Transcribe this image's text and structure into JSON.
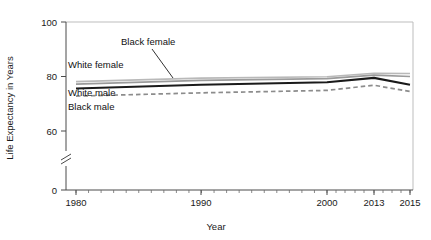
{
  "chart_data": {
    "type": "line",
    "title": "",
    "xlabel": "Year",
    "ylabel": "Life Expectancy in Years",
    "x": [
      1980,
      1990,
      2000,
      2013,
      2015
    ],
    "xtick_labels": [
      "1980",
      "1990",
      "2000",
      "2013",
      "2015"
    ],
    "ytick_labels": [
      "0",
      "60",
      "80",
      "100"
    ],
    "ytick_values": [
      0,
      60,
      80,
      100
    ],
    "ylim": [
      0,
      100
    ],
    "y_axis_break": true,
    "y_axis_break_between": [
      0,
      60
    ],
    "grid": false,
    "legend_position": "inline-labels",
    "series": [
      {
        "name": "White female",
        "color": "#b9b9b9",
        "style": "solid",
        "values": [
          78.1,
          79.4,
          79.9,
          81.2,
          81.1
        ]
      },
      {
        "name": "Black female",
        "color": "#9a9a9a",
        "style": "solid",
        "values": [
          77.2,
          78.6,
          79.2,
          80.5,
          80.0
        ]
      },
      {
        "name": "White male",
        "color": "#1a1a1a",
        "style": "solid",
        "values": [
          75.6,
          77.0,
          77.9,
          79.5,
          77.0
        ]
      },
      {
        "name": "Black male",
        "color": "#8c8c8c",
        "style": "dashed",
        "values": [
          72.8,
          74.0,
          74.9,
          76.8,
          74.5
        ]
      }
    ],
    "annotations": [
      {
        "text": "Black female",
        "leader_line": true
      },
      {
        "text": "White female",
        "leader_line": false
      },
      {
        "text": "White male",
        "leader_line": false
      },
      {
        "text": "Black male",
        "leader_line": false
      }
    ]
  }
}
